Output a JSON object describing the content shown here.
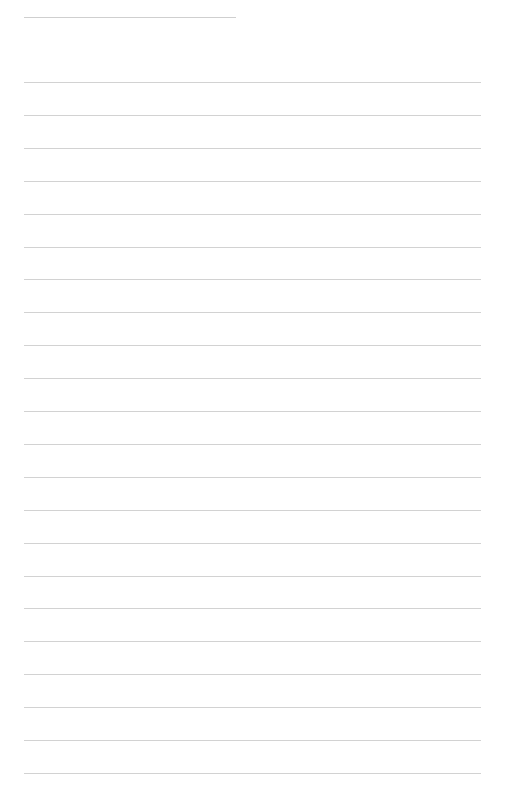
{
  "page": {
    "type": "lined-notebook-page",
    "width": 507,
    "height": 807,
    "background_color": "#ffffff",
    "line_color": "#d2d2d2"
  },
  "header_line": {
    "x_start": 24,
    "x_end": 236,
    "y": 17,
    "text": ""
  },
  "ruled_lines": {
    "x_start": 24,
    "x_end": 481,
    "first_y": 82,
    "spacing": 32.9,
    "count": 22,
    "texts": [
      "",
      "",
      "",
      "",
      "",
      "",
      "",
      "",
      "",
      "",
      "",
      "",
      "",
      "",
      "",
      "",
      "",
      "",
      "",
      "",
      "",
      ""
    ]
  }
}
